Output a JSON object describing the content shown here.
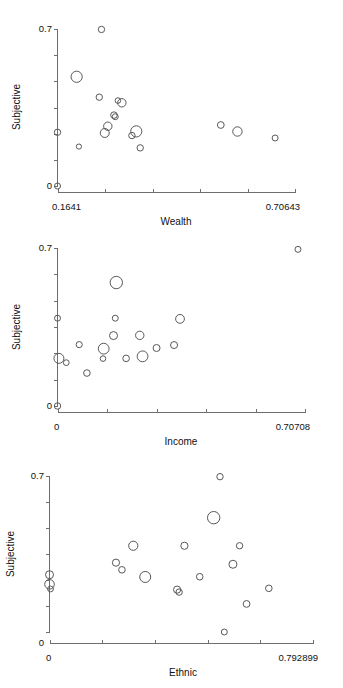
{
  "page": {
    "background": "#ffffff",
    "point_color": "#58585c",
    "axis_color": "#6e6e6e",
    "text_color": "#111111",
    "width": 343,
    "height": 688
  },
  "chart_data": [
    {
      "type": "scatter",
      "title": "",
      "xlabel": "Wealth",
      "ylabel": "Subjective",
      "xlim": [
        0.1641,
        0.70643
      ],
      "ylim": [
        0,
        0.7
      ],
      "xticklabels": [
        "0.1641",
        "0.70643"
      ],
      "yticklabels": [
        "0.7",
        "0"
      ],
      "x_minor_ticks": 5,
      "y_minor_ticks": 6,
      "grid": false,
      "legend": "none",
      "note": "bubble sizes encode a third variable; r in px",
      "points": [
        {
          "x": 0.1641,
          "y": 0.0,
          "r": 3.0
        },
        {
          "x": 0.1641,
          "y": 0.2395,
          "r": 3.2
        },
        {
          "x": 0.213,
          "y": 0.1758,
          "r": 2.6
        },
        {
          "x": 0.2078,
          "y": 0.487,
          "r": 5.6
        },
        {
          "x": 0.2645,
          "y": 0.698,
          "r": 3.2
        },
        {
          "x": 0.2595,
          "y": 0.396,
          "r": 3.2
        },
        {
          "x": 0.272,
          "y": 0.2365,
          "r": 4.5
        },
        {
          "x": 0.279,
          "y": 0.2665,
          "r": 4.2
        },
        {
          "x": 0.293,
          "y": 0.316,
          "r": 3.3
        },
        {
          "x": 0.296,
          "y": 0.309,
          "r": 3.0
        },
        {
          "x": 0.302,
          "y": 0.381,
          "r": 2.8
        },
        {
          "x": 0.311,
          "y": 0.371,
          "r": 4.2
        },
        {
          "x": 0.334,
          "y": 0.225,
          "r": 3.2
        },
        {
          "x": 0.344,
          "y": 0.2435,
          "r": 5.6
        },
        {
          "x": 0.353,
          "y": 0.17,
          "r": 3.2
        },
        {
          "x": 0.537,
          "y": 0.272,
          "r": 3.4
        },
        {
          "x": 0.575,
          "y": 0.243,
          "r": 4.7
        },
        {
          "x": 0.661,
          "y": 0.214,
          "r": 3.0
        }
      ]
    },
    {
      "type": "scatter",
      "title": "",
      "xlabel": "Income",
      "ylabel": "Subjective",
      "xlim": [
        0,
        0.70708
      ],
      "ylim": [
        0,
        0.7
      ],
      "xticklabels": [
        "0",
        "0.70708"
      ],
      "yticklabels": [
        "0.7",
        "0"
      ],
      "x_minor_ticks": 5,
      "y_minor_ticks": 6,
      "grid": false,
      "legend": "none",
      "points": [
        {
          "x": 0.0,
          "y": 0.0,
          "r": 3.2
        },
        {
          "x": 0.0,
          "y": 0.389,
          "r": 3.0
        },
        {
          "x": 0.004,
          "y": 0.211,
          "r": 5.0
        },
        {
          "x": 0.025,
          "y": 0.192,
          "r": 2.9
        },
        {
          "x": 0.062,
          "y": 0.272,
          "r": 3.1
        },
        {
          "x": 0.084,
          "y": 0.146,
          "r": 3.3
        },
        {
          "x": 0.13,
          "y": 0.21,
          "r": 2.8
        },
        {
          "x": 0.132,
          "y": 0.254,
          "r": 5.4
        },
        {
          "x": 0.165,
          "y": 0.389,
          "r": 3.0
        },
        {
          "x": 0.16,
          "y": 0.312,
          "r": 4.0
        },
        {
          "x": 0.168,
          "y": 0.547,
          "r": 6.2
        },
        {
          "x": 0.196,
          "y": 0.211,
          "r": 3.3
        },
        {
          "x": 0.235,
          "y": 0.313,
          "r": 4.2
        },
        {
          "x": 0.243,
          "y": 0.22,
          "r": 5.4
        },
        {
          "x": 0.283,
          "y": 0.257,
          "r": 3.5
        },
        {
          "x": 0.333,
          "y": 0.27,
          "r": 3.5
        },
        {
          "x": 0.35,
          "y": 0.386,
          "r": 4.4
        },
        {
          "x": 0.687,
          "y": 0.694,
          "r": 3.0
        }
      ]
    },
    {
      "type": "scatter",
      "title": "",
      "xlabel": "Ethnic",
      "ylabel": "Subjective",
      "xlim": [
        0,
        0.792899
      ],
      "ylim": [
        0,
        0.7
      ],
      "xticklabels": [
        "0",
        "0.792899"
      ],
      "yticklabels": [
        "0.7",
        "0"
      ],
      "x_minor_ticks": 5,
      "y_minor_ticks": 6,
      "grid": false,
      "legend": "none",
      "points": [
        {
          "x": 0.0,
          "y": 0.257,
          "r": 4.0
        },
        {
          "x": 0.0,
          "y": 0.214,
          "r": 4.8
        },
        {
          "x": 0.003,
          "y": 0.193,
          "r": 2.9
        },
        {
          "x": 0.2,
          "y": 0.311,
          "r": 3.6
        },
        {
          "x": 0.218,
          "y": 0.279,
          "r": 3.3
        },
        {
          "x": 0.252,
          "y": 0.387,
          "r": 4.6
        },
        {
          "x": 0.288,
          "y": 0.247,
          "r": 5.5
        },
        {
          "x": 0.384,
          "y": 0.19,
          "r": 3.6
        },
        {
          "x": 0.39,
          "y": 0.179,
          "r": 3.2
        },
        {
          "x": 0.406,
          "y": 0.387,
          "r": 3.6
        },
        {
          "x": 0.452,
          "y": 0.248,
          "r": 3.3
        },
        {
          "x": 0.494,
          "y": 0.513,
          "r": 6.2
        },
        {
          "x": 0.513,
          "y": 0.697,
          "r": 3.2
        },
        {
          "x": 0.526,
          "y": 0.0,
          "r": 3.0
        },
        {
          "x": 0.552,
          "y": 0.304,
          "r": 4.0
        },
        {
          "x": 0.572,
          "y": 0.387,
          "r": 3.2
        },
        {
          "x": 0.593,
          "y": 0.126,
          "r": 3.4
        },
        {
          "x": 0.66,
          "y": 0.196,
          "r": 3.3
        }
      ]
    }
  ]
}
